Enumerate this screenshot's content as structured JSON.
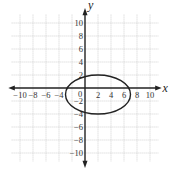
{
  "chart_data": {
    "type": "line",
    "title": "",
    "xlabel": "x",
    "ylabel": "y",
    "xlim": [
      -11,
      11
    ],
    "ylim": [
      -11,
      11
    ],
    "grid": true,
    "x_ticks": [
      -10,
      -8,
      -6,
      -4,
      2,
      4,
      6,
      8,
      10
    ],
    "x_tick_labels": [
      "−10",
      "−8",
      "−6",
      "−4",
      "2",
      "4",
      "6",
      "8",
      "10"
    ],
    "y_ticks": [
      10,
      8,
      6,
      4,
      2,
      -2,
      -4,
      -6,
      -8,
      -10
    ],
    "y_tick_labels": [
      "10",
      "8",
      "6",
      "4",
      "2",
      "−2",
      "−4",
      "−6",
      "−8",
      "−10"
    ],
    "origin_label": "0",
    "series": [
      {
        "name": "ellipse",
        "shape": "ellipse",
        "center": [
          2,
          -1
        ],
        "semi_axis_x": 5,
        "semi_axis_y": 3,
        "x_extent": [
          -3,
          7
        ],
        "y_extent": [
          -4,
          2
        ]
      }
    ]
  }
}
